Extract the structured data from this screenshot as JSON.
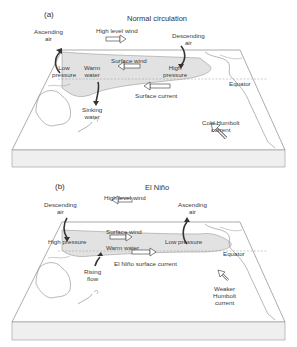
{
  "panel_a": {
    "tag": "(a)",
    "title": "Normal circulation",
    "labels": {
      "ascending_air": [
        "Ascending",
        "air"
      ],
      "high_level_wind": "High level wind",
      "descending_air": [
        "Descending",
        "air"
      ],
      "low_pressure": [
        "Low",
        "pressure"
      ],
      "warm_water": [
        "Warm",
        "water"
      ],
      "surface_wind": "Surface wind",
      "high_pressure": [
        "High",
        "pressure"
      ],
      "surface_current": "Surface current",
      "equator": "Equator",
      "sinking_water": [
        "Sinking",
        "water"
      ],
      "cold_humbolt_current": [
        "Cold Humbolt",
        "current"
      ]
    },
    "arrows": {
      "high_level_wind": "right",
      "surface_wind": "left",
      "surface_current": "left",
      "humbolt_current": "up-left"
    }
  },
  "panel_b": {
    "tag": "(b)",
    "title": "El Niño",
    "labels": {
      "descending_air": [
        "Descending",
        "air"
      ],
      "high_level_wind": "High level wind",
      "ascending_air": [
        "Ascending",
        "air"
      ],
      "high_pressure": "High pressure",
      "surface_wind": "Surface wind",
      "low_pressure": "Low pressure",
      "warm_water": "Warm water",
      "equator": "Equator",
      "rising_flow": [
        "Rising",
        "flow"
      ],
      "el_nino_surface_current": "El Niño surface current",
      "weaker_humbolt_current": [
        "Weaker",
        "Humbolt",
        "current"
      ]
    },
    "arrows": {
      "high_level_wind": "left",
      "surface_wind": "right",
      "el_nino_surface_current": "right",
      "humbolt_current": "up-left"
    }
  },
  "colors": {
    "outline": "#777777",
    "warm_pool": "#e2e2e2",
    "box_side": "#efefef",
    "text": "#333333"
  }
}
